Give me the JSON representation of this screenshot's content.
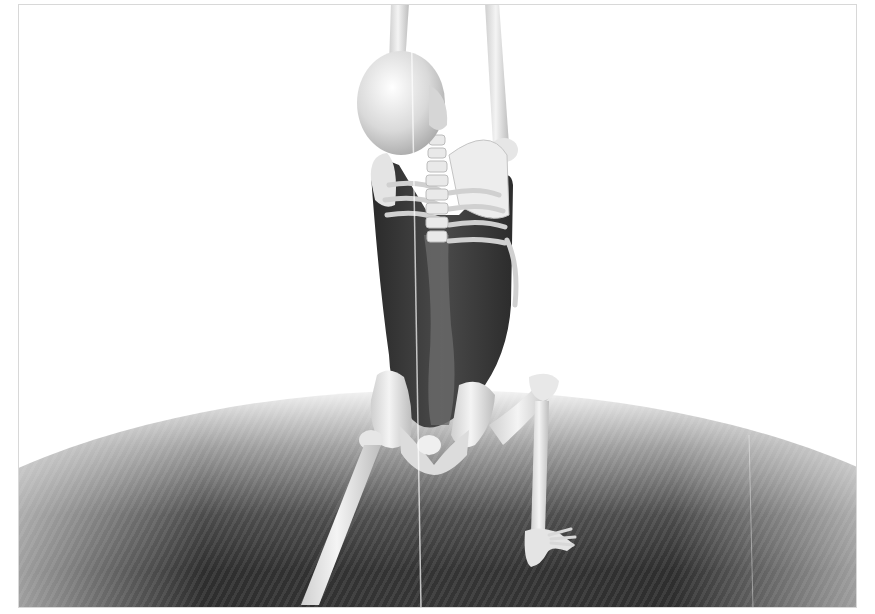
{
  "scene": {
    "description": "3D anatomical render of a human skeleton viewed from behind, hanging by the arms, with the latissimus dorsi / back muscle highlighted in dark tone, standing on a dark textured hemispherical ground",
    "palette": {
      "background": "#ffffff",
      "bone": "#e8e8e8",
      "bone_shadow": "#b0b0b0",
      "muscle": "#3a3a3a",
      "ground": "#2e2e2e",
      "frame_border": "#d8d8d8"
    },
    "elements": [
      "skull",
      "arms-raised",
      "spine",
      "rib-cage",
      "scapula",
      "back-muscle",
      "pelvis",
      "left-leg",
      "right-leg",
      "right-foot",
      "ground"
    ]
  }
}
